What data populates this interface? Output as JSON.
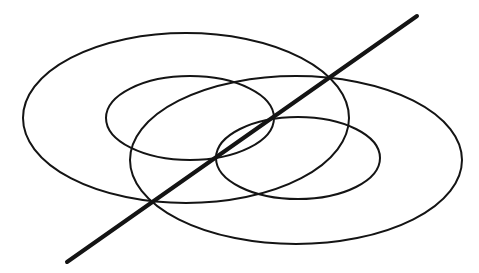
{
  "canvas": {
    "width": 479,
    "height": 273,
    "background": "#ffffff"
  },
  "stroke_color": "#141414",
  "ellipses": [
    {
      "name": "large-left-ellipse",
      "cx": 186,
      "cy": 118,
      "rx": 163,
      "ry": 85,
      "stroke_width": 2
    },
    {
      "name": "small-left-ellipse",
      "cx": 190,
      "cy": 118,
      "rx": 84,
      "ry": 42,
      "stroke_width": 2
    },
    {
      "name": "large-right-ellipse",
      "cx": 296,
      "cy": 160,
      "rx": 166,
      "ry": 84,
      "stroke_width": 2
    },
    {
      "name": "small-right-ellipse",
      "cx": 298,
      "cy": 158,
      "rx": 82,
      "ry": 41,
      "stroke_width": 2
    }
  ],
  "line": {
    "name": "diagonal-axis-line",
    "x1": 67,
    "y1": 262,
    "x2": 417,
    "y2": 16,
    "stroke_width": 4
  }
}
